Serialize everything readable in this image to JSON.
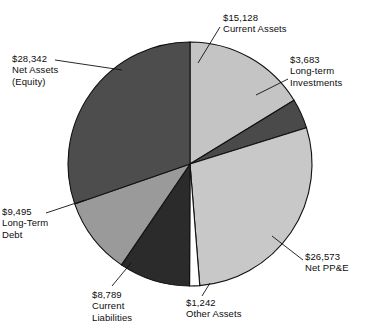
{
  "chart_data": {
    "type": "pie",
    "title": "",
    "subtitle": "",
    "legend_position": "callout-labels",
    "grid": false,
    "units": "USD",
    "total": 93129,
    "start_angle_deg": 0,
    "direction": "clockwise",
    "categories": [
      "Current Assets",
      "Long-term Investments",
      "Net PP&E",
      "Other Assets",
      "Current Liabilities",
      "Long-Term Debt",
      "Net Assets (Equity)"
    ],
    "values": [
      15128,
      3683,
      26573,
      1242,
      8789,
      9495,
      28342
    ],
    "value_labels": [
      "$15,128",
      "$3,683",
      "$26,573",
      "$1,242",
      "$8,789",
      "$9,495",
      "$28,342"
    ],
    "colors": [
      "#c4c4c4",
      "#4a4a4a",
      "#c8c8c8",
      "#ffffff",
      "#2b2b2b",
      "#9a9a9a",
      "#4d4d4d"
    ],
    "slices": [
      {
        "name": "Current Assets",
        "amount_label": "$15,128",
        "value": 15128,
        "color": "#c4c4c4",
        "start_deg": 0,
        "end_deg": 58.5
      },
      {
        "name": "Long-term Investments",
        "amount_label": "$3,683",
        "value": 3683,
        "color": "#4a4a4a",
        "start_deg": 58.5,
        "end_deg": 72.7
      },
      {
        "name": "Net PP&E",
        "amount_label": "$26,573",
        "value": 26573,
        "color": "#c8c8c8",
        "start_deg": 72.7,
        "end_deg": 175.4
      },
      {
        "name": "Other Assets",
        "amount_label": "$1,242",
        "value": 1242,
        "color": "#ffffff",
        "start_deg": 175.4,
        "end_deg": 180.2
      },
      {
        "name": "Current Liabilities",
        "amount_label": "$8,789",
        "value": 8789,
        "color": "#2b2b2b",
        "start_deg": 180.2,
        "end_deg": 214.2
      },
      {
        "name": "Long-Term Debt",
        "amount_label": "$9,495",
        "value": 9495,
        "color": "#9a9a9a",
        "start_deg": 214.2,
        "end_deg": 250.9
      },
      {
        "name": "Net Assets (Equity)",
        "amount_label": "$28,342",
        "value": 28342,
        "color": "#4d4d4d",
        "start_deg": 250.9,
        "end_deg": 360
      }
    ]
  },
  "labels": {
    "current_assets": {
      "amount": "$15,128",
      "name": "Current Assets"
    },
    "longterm_investments": {
      "amount": "$3,683",
      "line1": "Long-term",
      "line2": "Investments"
    },
    "net_ppe": {
      "amount": "$26,573",
      "name": "Net PP&E"
    },
    "other_assets": {
      "amount": "$1,242",
      "name": "Other Assets"
    },
    "current_liabilities": {
      "amount": "$8,789",
      "line1": "Current",
      "line2": "Liabilities"
    },
    "longterm_debt": {
      "amount": "$9,495",
      "line1": "Long-Term",
      "line2": "Debt"
    },
    "net_assets": {
      "amount": "$28,342",
      "line1": "Net Assets",
      "line2": "(Equity)"
    }
  }
}
